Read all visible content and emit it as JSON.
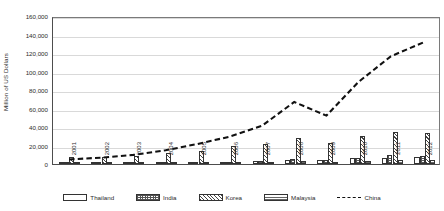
{
  "chart_data": {
    "type": "bar",
    "title": "",
    "subtitle": "",
    "xlabel": "",
    "ylabel": "Million of US Dollars",
    "ylim": [
      0,
      160000
    ],
    "ytick_step": 20000,
    "ytick_labels": [
      "160,000",
      "140,000",
      "120,000",
      "100,000",
      "80,000",
      "60,000",
      "40,000",
      "20,000",
      "0"
    ],
    "ytick_values": [
      160000,
      140000,
      120000,
      100000,
      80000,
      60000,
      40000,
      20000,
      0
    ],
    "grid": true,
    "legend_position": "bottom",
    "categories": [
      "2001",
      "2002",
      "2003",
      "2004",
      "2005",
      "2006",
      "2007",
      "2008",
      "2009",
      "2010",
      "2011",
      "2012"
    ],
    "series": [
      {
        "name": "Thailand",
        "type": "bar",
        "pattern": "solid-white",
        "values": [
          1200,
          1300,
          1500,
          1800,
          2200,
          2600,
          3500,
          4500,
          4200,
          6000,
          7000,
          7500
        ]
      },
      {
        "name": "India",
        "type": "bar",
        "pattern": "grid-hatch",
        "values": [
          900,
          1000,
          1200,
          1500,
          1900,
          2400,
          3000,
          5500,
          4500,
          7000,
          9500,
          9000
        ]
      },
      {
        "name": "Korea",
        "type": "bar",
        "pattern": "diagonal-hatch",
        "values": [
          8000,
          8000,
          9000,
          12000,
          14000,
          19000,
          22000,
          28000,
          23000,
          30000,
          35000,
          33000
        ]
      },
      {
        "name": "Malaysia",
        "type": "bar",
        "pattern": "horizontal-hatch",
        "values": [
          1500,
          1200,
          1300,
          1500,
          1700,
          2000,
          2500,
          3000,
          2500,
          3500,
          4000,
          4000
        ]
      },
      {
        "name": "China",
        "type": "line",
        "style": "dashed",
        "values": [
          5000,
          7000,
          10000,
          15000,
          22000,
          30000,
          42000,
          68000,
          53000,
          90000,
          118000,
          133000
        ]
      }
    ],
    "legend": [
      {
        "label": "Thailand",
        "swatch": "solid-white"
      },
      {
        "label": "India",
        "swatch": "grid-hatch"
      },
      {
        "label": "Korea",
        "swatch": "diagonal-hatch"
      },
      {
        "label": "Malaysia",
        "swatch": "horizontal-hatch"
      },
      {
        "label": "China",
        "swatch": "dashed-line"
      }
    ]
  }
}
